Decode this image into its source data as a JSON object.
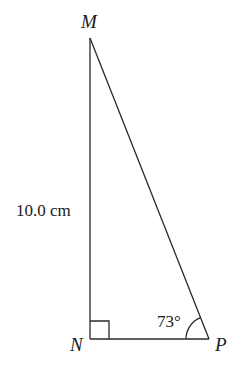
{
  "diagram": {
    "type": "right-triangle",
    "vertices": {
      "M": {
        "label": "M",
        "x": 90,
        "y": 38
      },
      "N": {
        "label": "N",
        "x": 90,
        "y": 339
      },
      "P": {
        "label": "P",
        "x": 209,
        "y": 339
      }
    },
    "side_MN_label": "10.0 cm",
    "angle_P_label": "73°",
    "right_angle_at": "N",
    "colors": {
      "stroke": "#2a2a2a",
      "text": "#1a1a1a",
      "background": "#ffffff"
    }
  }
}
